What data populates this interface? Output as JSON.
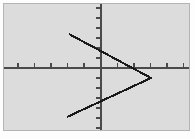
{
  "figure": {
    "background_color": "#dcdcdc",
    "border_color": "#b4b4b4",
    "page_background_color": "#fdfdfd",
    "axis_color": "#4a4a4a",
    "curve_color": "#1a1a1a",
    "title": "",
    "caption": ""
  },
  "chart_data": {
    "type": "line",
    "title": "",
    "subtitle": "",
    "xlabel": "",
    "ylabel": "",
    "grid": false,
    "legend": null,
    "legend_position": "none",
    "annotations": [],
    "xlim": [
      -6,
      5.5
    ],
    "ylim": [
      -6.5,
      6.5
    ],
    "xticks": [
      -5,
      -4,
      -3,
      -2,
      -1,
      1,
      2,
      3,
      4,
      5
    ],
    "yticks": [
      -6,
      -5,
      -4,
      -3,
      -2,
      -1,
      1,
      2,
      3,
      4,
      5,
      6
    ],
    "xtick_labels": [],
    "ytick_labels": [],
    "axis_origin_px": {
      "x": 97,
      "y": 64
    },
    "px_per_unit": {
      "x": 16.5,
      "y": 10.0
    },
    "series": [
      {
        "name": "upper-branch",
        "type": "line",
        "points": [
          [
            -1.87,
            3.1
          ],
          [
            2.95,
            -0.95
          ]
        ]
      },
      {
        "name": "lower-branch",
        "type": "line",
        "points": [
          [
            -2.0,
            -4.95
          ],
          [
            2.95,
            -0.95
          ]
        ]
      }
    ],
    "vertex": [
      2.95,
      -0.95
    ],
    "shape": "sideways-v-opening-left",
    "polyline_px": [
      [
        65,
        30
      ],
      [
        147,
        74
      ],
      [
        63,
        113
      ]
    ]
  },
  "axes": {
    "x_axis_name": "x-axis",
    "y_axis_name": "y-axis",
    "x_axis_px_y": 64,
    "y_axis_px_x": 97,
    "tick_length_px": 5,
    "x_tick_px": [
      14,
      30.5,
      47,
      63.5,
      80,
      113.5,
      130,
      146.5,
      163,
      179.5
    ],
    "y_tick_px": [
      4,
      14,
      24,
      34,
      44,
      54,
      74,
      84,
      94,
      104,
      114,
      124
    ]
  }
}
